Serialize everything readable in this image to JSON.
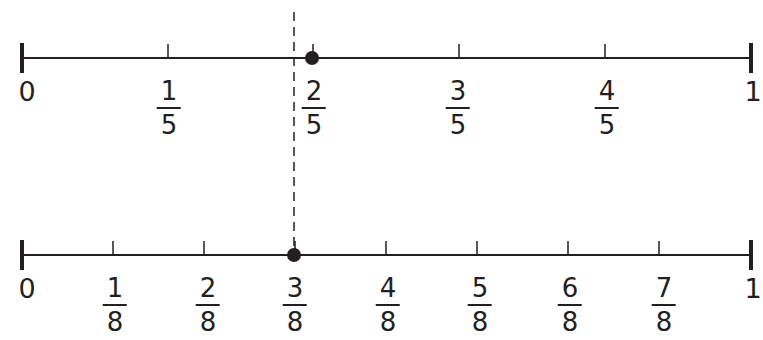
{
  "diagram": {
    "title": "",
    "colors": {
      "line": "#231f20",
      "dot": "#231f20",
      "background": "#ffffff"
    },
    "number_lines": [
      {
        "name": "fifths",
        "start_label": "0",
        "end_label": "1",
        "ticks": [
          {
            "num": "1",
            "den": "5"
          },
          {
            "num": "2",
            "den": "5"
          },
          {
            "num": "3",
            "den": "5"
          },
          {
            "num": "4",
            "den": "5"
          }
        ],
        "marked_point": "2/5"
      },
      {
        "name": "eighths",
        "start_label": "0",
        "end_label": "1",
        "ticks": [
          {
            "num": "1",
            "den": "8"
          },
          {
            "num": "2",
            "den": "8"
          },
          {
            "num": "3",
            "den": "8"
          },
          {
            "num": "4",
            "den": "8"
          },
          {
            "num": "5",
            "den": "8"
          },
          {
            "num": "6",
            "den": "8"
          },
          {
            "num": "7",
            "den": "8"
          }
        ],
        "marked_point": "3/8"
      }
    ],
    "comparison_line": {
      "style": "dashed",
      "through": "3/8"
    }
  }
}
